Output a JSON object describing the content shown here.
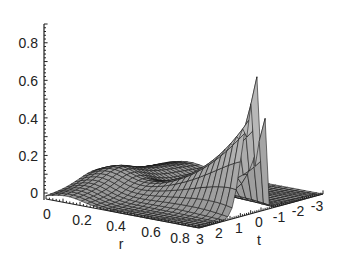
{
  "chart_data": {
    "type": "surface3d",
    "title": "",
    "xlabel": "r",
    "ylabel": "t",
    "zlabel": "",
    "x_ticks": [
      "0",
      "0.2",
      "0.4",
      "0.6",
      "0.8"
    ],
    "y_ticks": [
      "3",
      "2",
      "1",
      "0",
      "-1",
      "-2",
      "-3"
    ],
    "z_ticks": [
      "0",
      "0.2",
      "0.4",
      "0.6",
      "0.8"
    ],
    "xlim": [
      0,
      0.9
    ],
    "ylim": [
      -3,
      3
    ],
    "zlim": [
      0,
      0.9
    ],
    "surface_color": "#a8a8a8",
    "grid_line_color": "#1a1a1a",
    "features": [
      {
        "r": 0.1,
        "t": 2.5,
        "z": 0.1
      },
      {
        "r": 0.5,
        "t": 0.5,
        "z": 0.15
      },
      {
        "r": 0.8,
        "t": 0.5,
        "z": 0.4
      },
      {
        "r": 0.85,
        "t": 0.1,
        "z": 0.85
      },
      {
        "r": 0.85,
        "t": -0.1,
        "z": 0.85
      },
      {
        "r": 0.85,
        "t": -3,
        "z": 0.02
      }
    ]
  }
}
